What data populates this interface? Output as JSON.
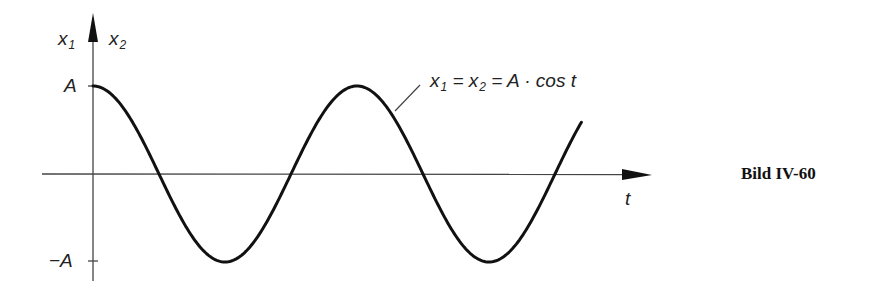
{
  "chart_data": {
    "type": "line",
    "title": "",
    "caption": "Bild IV-60",
    "xlabel": "t",
    "ylabel_left": "x1",
    "ylabel_right": "x2",
    "y_ticks": [
      "A",
      "-A"
    ],
    "ylim": [
      -1,
      1
    ],
    "grid": false,
    "legend": null,
    "annotation": "x1 = x2 = A · cos t",
    "series": [
      {
        "name": "x1 = x2 = A · cos t",
        "function": "A*cos(t)",
        "t_range_periods": [
          0,
          1.85
        ],
        "zero_crossings_periods": [
          0.25,
          0.75,
          1.25,
          1.75
        ],
        "maxima_periods": [
          0,
          1
        ],
        "minima_periods": [
          0.5,
          1.5
        ]
      }
    ]
  },
  "labels": {
    "x1_base": "x",
    "x1_sub": "1",
    "x2_base": "x",
    "x2_sub": "2",
    "tick_A": "A",
    "tick_negA": "−A",
    "t_axis": "t",
    "formula_x": "x",
    "formula_sub1": "1",
    "formula_eq1": " = x",
    "formula_sub2": "2",
    "formula_rest": " = A · cos t",
    "caption": "Bild IV-60"
  },
  "colors": {
    "axis": "#333333",
    "curve": "#111111"
  }
}
